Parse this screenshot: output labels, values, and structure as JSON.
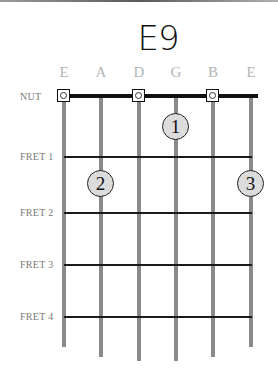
{
  "chord": {
    "name": "E9"
  },
  "strings": [
    {
      "name": "E",
      "x": 64,
      "bottom": 347
    },
    {
      "name": "A",
      "x": 101,
      "bottom": 357
    },
    {
      "name": "D",
      "x": 139,
      "bottom": 361
    },
    {
      "name": "G",
      "x": 176,
      "bottom": 361
    },
    {
      "name": "B",
      "x": 213,
      "bottom": 357
    },
    {
      "name": "E",
      "x": 251,
      "bottom": 347
    }
  ],
  "labels": {
    "nut": "NUT",
    "frets": [
      "FRET 1",
      "FRET 2",
      "FRET 3",
      "FRET 4"
    ]
  },
  "open_strings": [
    0,
    2,
    4
  ],
  "fingers": [
    {
      "finger": "1",
      "string": 3,
      "fret": 1
    },
    {
      "finger": "2",
      "string": 1,
      "fret": 2
    },
    {
      "finger": "3",
      "string": 5,
      "fret": 2
    }
  ],
  "colors": {
    "string": "#8a8a8a",
    "string_label": "#b5b5b5",
    "finger_fill": "#dcdcdc",
    "nut": "#111111"
  }
}
